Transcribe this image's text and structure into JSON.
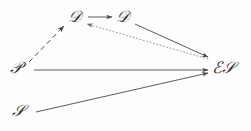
{
  "diagram": {
    "type": "directed-graph",
    "background_color": "#fdfdfd",
    "stroke_color": "#4a4a4a",
    "label_color": "#2e2e2e",
    "nodes": [
      {
        "id": "T",
        "label": "𝒟",
        "glyph_text": "T",
        "name": "node-t",
        "x": 76,
        "y": 18
      },
      {
        "id": "D",
        "label": "𝒟",
        "glyph_text": "D",
        "name": "node-d",
        "x": 124,
        "y": 18
      },
      {
        "id": "P",
        "label": "𝒫",
        "glyph_text": "P",
        "name": "node-p",
        "x": 18,
        "y": 69
      },
      {
        "id": "S",
        "label": "𝒮",
        "glyph_text": "S",
        "name": "node-s",
        "x": 20,
        "y": 112
      },
      {
        "id": "ES",
        "label": "ℰ𝒮",
        "glyph_text": "ES",
        "name": "node-es",
        "x": 224,
        "y": 69
      }
    ],
    "edges": [
      {
        "id": "p-to-t",
        "from": "P",
        "to": "T",
        "style": "dashed",
        "arrow": "forward",
        "name": "edge-p-to-t"
      },
      {
        "id": "t-to-d",
        "from": "T",
        "to": "D",
        "style": "solid",
        "arrow": "forward",
        "name": "edge-t-to-d"
      },
      {
        "id": "es-to-t",
        "from": "ES",
        "to": "T",
        "style": "dotted",
        "arrow": "forward",
        "name": "edge-es-to-t"
      },
      {
        "id": "d-to-es",
        "from": "D",
        "to": "ES",
        "style": "solid",
        "arrow": "forward",
        "name": "edge-d-to-es"
      },
      {
        "id": "p-to-es",
        "from": "P",
        "to": "ES",
        "style": "solid",
        "arrow": "forward",
        "name": "edge-p-to-es"
      },
      {
        "id": "s-to-es",
        "from": "S",
        "to": "ES",
        "style": "solid",
        "arrow": "forward",
        "name": "edge-s-to-es"
      }
    ]
  }
}
